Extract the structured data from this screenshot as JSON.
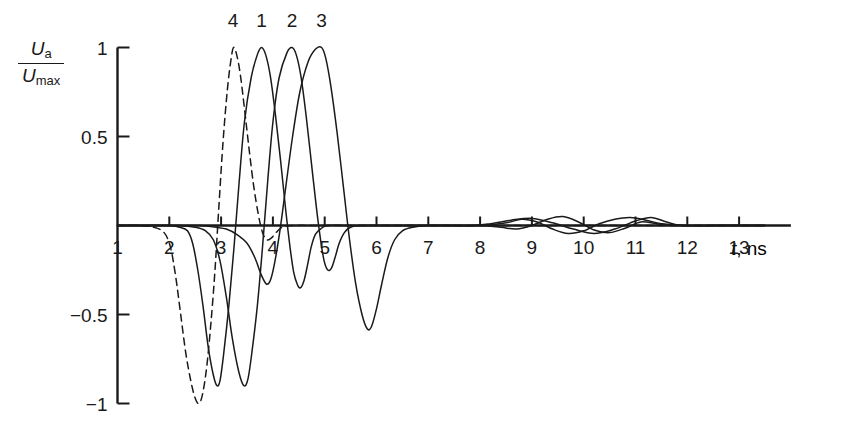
{
  "figure": {
    "background_color": "#ffffff",
    "line_color": "#1a1a1a",
    "axis_color": "#1a1a1a"
  },
  "axes": {
    "y_label_numerator": "U",
    "y_label_numerator_sub": "a",
    "y_label_denominator": "U",
    "y_label_denominator_sub": "max",
    "x_label_symbol": "t",
    "x_label_unit": ", ns"
  },
  "chart_data": {
    "type": "line",
    "title": "",
    "xlabel": "t, ns",
    "ylabel": "Ua/Umax",
    "xlim": [
      0.85,
      14.0
    ],
    "ylim": [
      -1.08,
      1.08
    ],
    "grid": false,
    "legend": "inline-curve-labels",
    "xticks": [
      1,
      2,
      3,
      4,
      5,
      6,
      7,
      8,
      9,
      10,
      11,
      12,
      13
    ],
    "xtick_labels": [
      "1",
      "2",
      "3",
      "4",
      "5",
      "6",
      "7",
      "8",
      "9",
      "10",
      "11",
      "12",
      "13"
    ],
    "yticks": [
      1,
      0.5,
      0,
      -0.5,
      -1
    ],
    "ytick_labels": [
      "1",
      "0.5",
      "",
      "-0.5",
      "-1"
    ],
    "curve_labels": [
      {
        "name": "4",
        "x": 3.23,
        "y": 1.18
      },
      {
        "name": "1",
        "x": 3.78,
        "y": 1.18
      },
      {
        "name": "2",
        "x": 4.37,
        "y": 1.18
      },
      {
        "name": "3",
        "x": 4.94,
        "y": 1.18
      }
    ],
    "series": [
      {
        "name": "1",
        "style": "solid",
        "points": [
          [
            1.0,
            0.0
          ],
          [
            1.6,
            0.0
          ],
          [
            2.0,
            0.0
          ],
          [
            2.2,
            -0.01
          ],
          [
            2.35,
            -0.03
          ],
          [
            2.45,
            -0.1
          ],
          [
            2.55,
            -0.25
          ],
          [
            2.65,
            -0.45
          ],
          [
            2.75,
            -0.68
          ],
          [
            2.85,
            -0.84
          ],
          [
            2.92,
            -0.9
          ],
          [
            2.98,
            -0.87
          ],
          [
            3.05,
            -0.72
          ],
          [
            3.15,
            -0.45
          ],
          [
            3.25,
            -0.12
          ],
          [
            3.35,
            0.25
          ],
          [
            3.45,
            0.58
          ],
          [
            3.58,
            0.83
          ],
          [
            3.7,
            0.96
          ],
          [
            3.78,
            1.0
          ],
          [
            3.86,
            0.96
          ],
          [
            3.95,
            0.84
          ],
          [
            4.05,
            0.62
          ],
          [
            4.15,
            0.36
          ],
          [
            4.25,
            0.08
          ],
          [
            4.33,
            -0.12
          ],
          [
            4.4,
            -0.26
          ],
          [
            4.47,
            -0.33
          ],
          [
            4.53,
            -0.35
          ],
          [
            4.6,
            -0.31
          ],
          [
            4.67,
            -0.22
          ],
          [
            4.74,
            -0.12
          ],
          [
            4.82,
            -0.05
          ],
          [
            4.92,
            -0.02
          ],
          [
            5.05,
            0.0
          ],
          [
            5.4,
            0.0
          ],
          [
            6.0,
            0.0
          ],
          [
            7.0,
            0.0
          ],
          [
            8.0,
            0.0
          ],
          [
            8.4,
            -0.01
          ],
          [
            8.7,
            -0.02
          ],
          [
            9.0,
            0.0
          ],
          [
            9.3,
            0.035
          ],
          [
            9.6,
            0.05
          ],
          [
            9.9,
            0.02
          ],
          [
            10.2,
            -0.025
          ],
          [
            10.5,
            -0.04
          ],
          [
            10.8,
            -0.015
          ],
          [
            11.1,
            0.02
          ],
          [
            11.4,
            0.01
          ],
          [
            11.7,
            0.0
          ],
          [
            12.5,
            0.0
          ],
          [
            13.5,
            0.0
          ]
        ]
      },
      {
        "name": "2",
        "style": "solid",
        "points": [
          [
            1.0,
            0.0
          ],
          [
            1.8,
            0.0
          ],
          [
            2.2,
            0.0
          ],
          [
            2.5,
            -0.01
          ],
          [
            2.7,
            -0.03
          ],
          [
            2.85,
            -0.08
          ],
          [
            2.98,
            -0.2
          ],
          [
            3.1,
            -0.4
          ],
          [
            3.22,
            -0.64
          ],
          [
            3.34,
            -0.82
          ],
          [
            3.44,
            -0.9
          ],
          [
            3.52,
            -0.86
          ],
          [
            3.6,
            -0.7
          ],
          [
            3.7,
            -0.45
          ],
          [
            3.8,
            -0.12
          ],
          [
            3.9,
            0.25
          ],
          [
            4.0,
            0.58
          ],
          [
            4.12,
            0.83
          ],
          [
            4.27,
            0.97
          ],
          [
            4.37,
            1.0
          ],
          [
            4.45,
            0.96
          ],
          [
            4.54,
            0.84
          ],
          [
            4.64,
            0.62
          ],
          [
            4.74,
            0.36
          ],
          [
            4.84,
            0.1
          ],
          [
            4.92,
            -0.08
          ],
          [
            4.99,
            -0.2
          ],
          [
            5.06,
            -0.25
          ],
          [
            5.13,
            -0.24
          ],
          [
            5.2,
            -0.18
          ],
          [
            5.28,
            -0.1
          ],
          [
            5.38,
            -0.04
          ],
          [
            5.5,
            -0.01
          ],
          [
            5.7,
            0.0
          ],
          [
            6.2,
            0.0
          ],
          [
            7.0,
            0.0
          ],
          [
            8.0,
            0.0
          ],
          [
            8.5,
            0.015
          ],
          [
            8.8,
            0.035
          ],
          [
            9.1,
            0.02
          ],
          [
            9.4,
            -0.02
          ],
          [
            9.7,
            -0.045
          ],
          [
            10.0,
            -0.03
          ],
          [
            10.3,
            0.01
          ],
          [
            10.6,
            0.035
          ],
          [
            10.9,
            0.045
          ],
          [
            11.2,
            0.03
          ],
          [
            11.5,
            0.01
          ],
          [
            11.9,
            0.0
          ],
          [
            12.8,
            0.0
          ],
          [
            13.5,
            0.0
          ]
        ]
      },
      {
        "name": "3",
        "style": "solid",
        "points": [
          [
            1.0,
            0.0
          ],
          [
            2.0,
            0.0
          ],
          [
            2.6,
            0.0
          ],
          [
            2.9,
            -0.01
          ],
          [
            3.1,
            -0.02
          ],
          [
            3.3,
            -0.05
          ],
          [
            3.5,
            -0.1
          ],
          [
            3.65,
            -0.18
          ],
          [
            3.78,
            -0.28
          ],
          [
            3.88,
            -0.33
          ],
          [
            3.96,
            -0.3
          ],
          [
            4.04,
            -0.2
          ],
          [
            4.14,
            -0.02
          ],
          [
            4.25,
            0.22
          ],
          [
            4.38,
            0.5
          ],
          [
            4.52,
            0.75
          ],
          [
            4.68,
            0.92
          ],
          [
            4.82,
            0.99
          ],
          [
            4.94,
            1.0
          ],
          [
            5.02,
            0.94
          ],
          [
            5.12,
            0.78
          ],
          [
            5.24,
            0.52
          ],
          [
            5.36,
            0.22
          ],
          [
            5.48,
            -0.08
          ],
          [
            5.6,
            -0.33
          ],
          [
            5.72,
            -0.5
          ],
          [
            5.82,
            -0.58
          ],
          [
            5.9,
            -0.57
          ],
          [
            5.99,
            -0.48
          ],
          [
            6.1,
            -0.33
          ],
          [
            6.22,
            -0.18
          ],
          [
            6.35,
            -0.08
          ],
          [
            6.5,
            -0.03
          ],
          [
            6.7,
            -0.01
          ],
          [
            7.0,
            0.0
          ],
          [
            7.8,
            0.0
          ],
          [
            8.2,
            0.01
          ],
          [
            8.6,
            0.03
          ],
          [
            9.0,
            0.04
          ],
          [
            9.4,
            0.015
          ],
          [
            9.8,
            -0.02
          ],
          [
            10.2,
            -0.045
          ],
          [
            10.6,
            -0.02
          ],
          [
            11.0,
            0.025
          ],
          [
            11.3,
            0.045
          ],
          [
            11.6,
            0.02
          ],
          [
            11.9,
            0.0
          ],
          [
            12.6,
            0.0
          ],
          [
            13.5,
            0.0
          ]
        ]
      },
      {
        "name": "4",
        "style": "dashed",
        "points": [
          [
            1.0,
            0.0
          ],
          [
            1.4,
            0.0
          ],
          [
            1.7,
            -0.01
          ],
          [
            1.9,
            -0.04
          ],
          [
            2.02,
            -0.12
          ],
          [
            2.12,
            -0.28
          ],
          [
            2.22,
            -0.5
          ],
          [
            2.32,
            -0.72
          ],
          [
            2.42,
            -0.88
          ],
          [
            2.5,
            -0.97
          ],
          [
            2.57,
            -1.0
          ],
          [
            2.64,
            -0.95
          ],
          [
            2.72,
            -0.8
          ],
          [
            2.8,
            -0.56
          ],
          [
            2.88,
            -0.26
          ],
          [
            2.96,
            0.12
          ],
          [
            3.04,
            0.48
          ],
          [
            3.12,
            0.76
          ],
          [
            3.19,
            0.93
          ],
          [
            3.24,
            1.0
          ],
          [
            3.3,
            0.96
          ],
          [
            3.37,
            0.85
          ],
          [
            3.45,
            0.66
          ],
          [
            3.54,
            0.43
          ],
          [
            3.63,
            0.22
          ],
          [
            3.72,
            0.06
          ],
          [
            3.8,
            -0.04
          ],
          [
            3.88,
            -0.08
          ],
          [
            3.97,
            -0.07
          ],
          [
            4.06,
            -0.04
          ],
          [
            4.18,
            -0.01
          ],
          [
            4.4,
            0.0
          ],
          [
            5.0,
            0.0
          ],
          [
            6.0,
            0.0
          ],
          [
            8.0,
            0.0
          ],
          [
            10.0,
            0.0
          ],
          [
            13.5,
            0.0
          ]
        ]
      }
    ]
  }
}
